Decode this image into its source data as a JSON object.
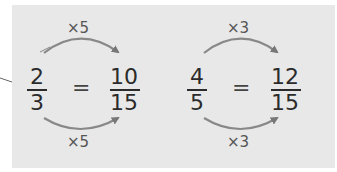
{
  "equations": [
    {
      "left": {
        "numerator": "2",
        "denominator": "3"
      },
      "equals": "=",
      "right": {
        "numerator": "10",
        "denominator": "15"
      },
      "top_multiplier": "×5",
      "bottom_multiplier": "×5"
    },
    {
      "left": {
        "numerator": "4",
        "denominator": "5"
      },
      "equals": "=",
      "right": {
        "numerator": "12",
        "denominator": "15"
      },
      "top_multiplier": "×3",
      "bottom_multiplier": "×3"
    }
  ],
  "colors": {
    "panel": "#e8e8e8",
    "arrow": "#777777",
    "text": "#2b2b2b"
  }
}
